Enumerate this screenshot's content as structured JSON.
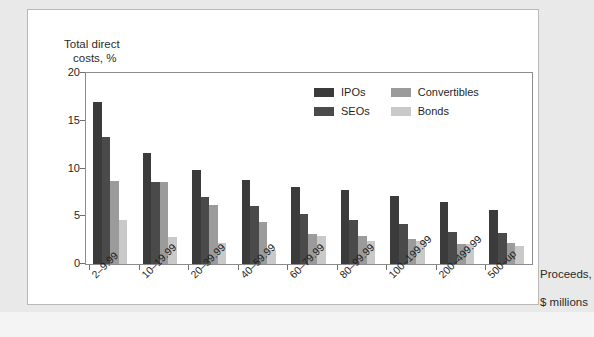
{
  "chart_data": {
    "type": "bar",
    "title": "",
    "ylabel": "Total direct\ncosts, %",
    "ylabel_line1": "Total direct",
    "ylabel_line2": "costs, %",
    "xlabel": "Proceeds,\n$ millions",
    "xlabel_line1": "Proceeds,",
    "xlabel_line2": "$ millions",
    "ylim": [
      0,
      20
    ],
    "yticks": [
      0,
      5,
      10,
      15,
      20
    ],
    "ytick_labels": [
      "0",
      "5",
      "10",
      "15",
      "20"
    ],
    "grid": false,
    "legend_position": "upper-center-right",
    "categories": [
      "2–9.99",
      "10–19.99",
      "20–39.99",
      "40–59.99",
      "60–79.99",
      "80–99.99",
      "100–199.99",
      "200–499.99",
      "500–up"
    ],
    "series": [
      {
        "name": "IPOs",
        "color": "#3b3b3b",
        "values": [
          17.0,
          11.6,
          9.8,
          8.8,
          8.1,
          7.8,
          7.1,
          6.5,
          5.7
        ]
      },
      {
        "name": "SEOs",
        "color": "#4a4a4a",
        "values": [
          13.3,
          8.6,
          7.0,
          6.1,
          5.2,
          4.6,
          4.2,
          3.4,
          3.2
        ]
      },
      {
        "name": "Convertibles",
        "color": "#9b9b9b",
        "values": [
          8.7,
          8.6,
          6.2,
          4.4,
          3.1,
          2.9,
          2.6,
          2.1,
          2.2
        ]
      },
      {
        "name": "Bonds",
        "color": "#c9c9c9",
        "values": [
          4.6,
          2.8,
          2.2,
          1.5,
          2.9,
          2.4,
          2.4,
          2.1,
          1.9
        ]
      }
    ],
    "legend": [
      "IPOs",
      "Convertibles",
      "SEOs",
      "Bonds"
    ]
  },
  "caption": ""
}
